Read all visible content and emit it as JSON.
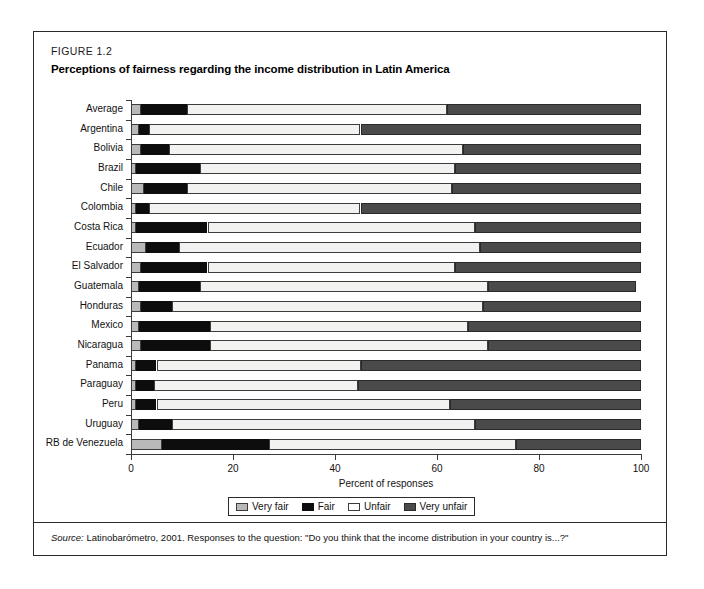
{
  "figure": {
    "label": "FIGURE 1.2",
    "title": "Perceptions of fairness regarding the income distribution in Latin America",
    "source_word": "Source:",
    "source_text": " Latinobarómetro, 2001. Responses to the question: \"Do you think that the income distribution in your country is...?\""
  },
  "colors": {
    "very_fair": "#b9b9b9",
    "fair": "#0d0d0d",
    "unfair": "#f2f2f0",
    "very_unfair": "#4a4a4a",
    "frame": "#2b2b2b",
    "axis": "#3a3a3a"
  },
  "legend": {
    "items": [
      {
        "label": "Very fair",
        "key": "very-fair"
      },
      {
        "label": "Fair",
        "key": "fair"
      },
      {
        "label": "Unfair",
        "key": "unfair"
      },
      {
        "label": "Very unfair",
        "key": "very-unfair"
      }
    ]
  },
  "chart_data": {
    "type": "bar",
    "orientation": "horizontal",
    "stacked": true,
    "title": "Perceptions of fairness regarding the income distribution in Latin America",
    "xlabel": "Percent of responses",
    "ylabel": "",
    "xlim": [
      0,
      100
    ],
    "xticks": [
      0,
      20,
      40,
      60,
      80,
      100
    ],
    "xticklabels": [
      "0",
      "20",
      "40",
      "60",
      "80",
      "100"
    ],
    "grid": false,
    "legend_position": "bottom",
    "categories": [
      "Average",
      "Argentina",
      "Bolivia",
      "Brazil",
      "Chile",
      "Colombia",
      "Costa Rica",
      "Ecuador",
      "El Salvador",
      "Guatemala",
      "Honduras",
      "Mexico",
      "Nicaragua",
      "Panama",
      "Paraguay",
      "Peru",
      "Uruguay",
      "RB de Venezuela"
    ],
    "series": [
      {
        "name": "Very fair",
        "color": "#b9b9b9",
        "values": [
          2.0,
          1.5,
          2.0,
          1.0,
          2.5,
          1.0,
          1.0,
          3.0,
          2.0,
          1.5,
          2.0,
          1.5,
          2.0,
          1.0,
          1.0,
          1.0,
          1.5,
          6.0
        ]
      },
      {
        "name": "Fair",
        "color": "#0d0d0d",
        "values": [
          9.0,
          2.0,
          5.5,
          12.5,
          8.5,
          2.5,
          14.0,
          6.5,
          13.0,
          12.0,
          6.0,
          14.0,
          13.5,
          4.0,
          3.5,
          4.0,
          6.5,
          21.0
        ]
      },
      {
        "name": "Unfair",
        "color": "#f2f2f0",
        "values": [
          51.0,
          41.5,
          57.5,
          50.0,
          52.0,
          41.5,
          52.5,
          59.0,
          48.5,
          56.5,
          61.0,
          50.5,
          54.5,
          40.0,
          40.0,
          57.5,
          59.5,
          48.5
        ]
      },
      {
        "name": "Very unfair",
        "color": "#4a4a4a",
        "values": [
          38.0,
          55.0,
          35.0,
          36.5,
          37.0,
          55.0,
          32.5,
          31.5,
          36.5,
          29.0,
          31.0,
          34.0,
          30.0,
          55.0,
          55.5,
          37.5,
          32.5,
          24.5
        ]
      }
    ],
    "rows": [
      {
        "category": "Average",
        "very_fair": 2.0,
        "fair": 9.0,
        "unfair": 51.0,
        "very_unfair": 38.0
      },
      {
        "category": "Argentina",
        "very_fair": 1.5,
        "fair": 2.0,
        "unfair": 41.5,
        "very_unfair": 55.0
      },
      {
        "category": "Bolivia",
        "very_fair": 2.0,
        "fair": 5.5,
        "unfair": 57.5,
        "very_unfair": 35.0
      },
      {
        "category": "Brazil",
        "very_fair": 1.0,
        "fair": 12.5,
        "unfair": 50.0,
        "very_unfair": 36.5
      },
      {
        "category": "Chile",
        "very_fair": 2.5,
        "fair": 8.5,
        "unfair": 52.0,
        "very_unfair": 37.0
      },
      {
        "category": "Colombia",
        "very_fair": 1.0,
        "fair": 2.5,
        "unfair": 41.5,
        "very_unfair": 55.0
      },
      {
        "category": "Costa Rica",
        "very_fair": 1.0,
        "fair": 14.0,
        "unfair": 52.5,
        "very_unfair": 32.5
      },
      {
        "category": "Ecuador",
        "very_fair": 3.0,
        "fair": 6.5,
        "unfair": 59.0,
        "very_unfair": 31.5
      },
      {
        "category": "El Salvador",
        "very_fair": 2.0,
        "fair": 13.0,
        "unfair": 48.5,
        "very_unfair": 36.5
      },
      {
        "category": "Guatemala",
        "very_fair": 1.5,
        "fair": 12.0,
        "unfair": 56.5,
        "very_unfair": 29.0
      },
      {
        "category": "Honduras",
        "very_fair": 2.0,
        "fair": 6.0,
        "unfair": 61.0,
        "very_unfair": 31.0
      },
      {
        "category": "Mexico",
        "very_fair": 1.5,
        "fair": 14.0,
        "unfair": 50.5,
        "very_unfair": 34.0
      },
      {
        "category": "Nicaragua",
        "very_fair": 2.0,
        "fair": 13.5,
        "unfair": 54.5,
        "very_unfair": 30.0
      },
      {
        "category": "Panama",
        "very_fair": 1.0,
        "fair": 4.0,
        "unfair": 40.0,
        "very_unfair": 55.0
      },
      {
        "category": "Paraguay",
        "very_fair": 1.0,
        "fair": 3.5,
        "unfair": 40.0,
        "very_unfair": 55.5
      },
      {
        "category": "Peru",
        "very_fair": 1.0,
        "fair": 4.0,
        "unfair": 57.5,
        "very_unfair": 37.5
      },
      {
        "category": "Uruguay",
        "very_fair": 1.5,
        "fair": 6.5,
        "unfair": 59.5,
        "very_unfair": 32.5
      },
      {
        "category": "RB de Venezuela",
        "very_fair": 6.0,
        "fair": 21.0,
        "unfair": 48.5,
        "very_unfair": 24.5
      }
    ]
  }
}
